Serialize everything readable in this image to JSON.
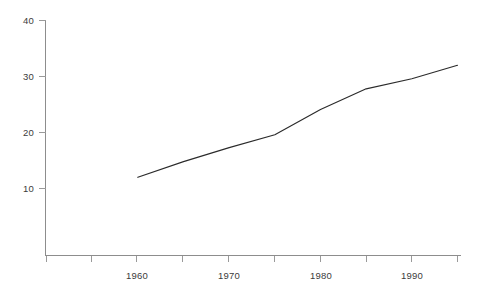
{
  "chart_data": {
    "type": "line",
    "title": "",
    "subtitle": "",
    "xlabel": "",
    "ylabel": "",
    "xlim": [
      1950,
      1995
    ],
    "ylim": [
      0,
      40
    ],
    "grid": false,
    "legend": false,
    "legend_position": "none",
    "x": [
      1960,
      1965,
      1970,
      1975,
      1980,
      1985,
      1990,
      1995
    ],
    "values": [
      12.0,
      14.8,
      17.3,
      19.6,
      24.1,
      27.8,
      29.6,
      32.0
    ],
    "series": [
      {
        "name": "series-1",
        "color": "#2b2b2b",
        "x": [
          1960,
          1965,
          1970,
          1975,
          1980,
          1985,
          1990,
          1995
        ],
        "values": [
          12.0,
          14.8,
          17.3,
          19.6,
          24.1,
          27.8,
          29.6,
          32.0
        ]
      }
    ],
    "x_ticks": [
      1950,
      1955,
      1960,
      1965,
      1970,
      1975,
      1980,
      1985,
      1990,
      1995
    ],
    "x_tick_labels": [
      "",
      "",
      "1960",
      "",
      "1970",
      "",
      "1980",
      "",
      "1990",
      ""
    ],
    "y_ticks": [
      10,
      20,
      30,
      40
    ],
    "y_tick_labels": [
      "10",
      "20",
      "30",
      "40"
    ],
    "axis_color": "#8d8d8d",
    "tick_color": "#9a9a9a",
    "text_color": "#3b3b3b",
    "background": "#ffffff"
  },
  "axes": {
    "y_labels": [
      {
        "text": "40",
        "value": 40
      },
      {
        "text": "30",
        "value": 30
      },
      {
        "text": "20",
        "value": 20
      },
      {
        "text": "10",
        "value": 10
      }
    ],
    "x_labels": [
      {
        "text": "1960",
        "value": 1960
      },
      {
        "text": "1970",
        "value": 1970
      },
      {
        "text": "1980",
        "value": 1980
      },
      {
        "text": "1990",
        "value": 1990
      }
    ]
  }
}
